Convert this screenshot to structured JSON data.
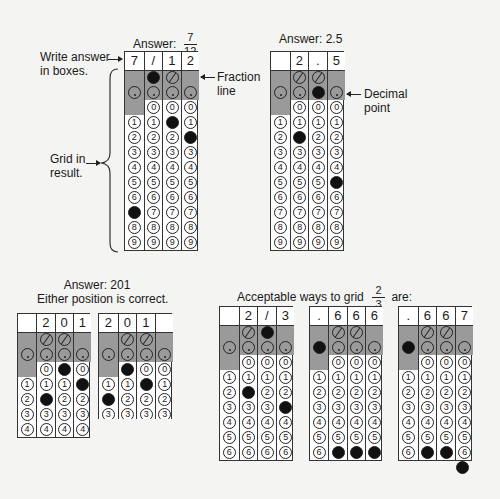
{
  "labels": {
    "write_answer": [
      "Write answer",
      "in boxes."
    ],
    "grid_in": [
      "Grid in",
      "result."
    ],
    "fraction_line": [
      "Fraction",
      "line"
    ],
    "decimal_point": [
      "Decimal",
      "point"
    ],
    "answer_201_title": "Answer: 201",
    "answer_201_sub": "Either position is correct.",
    "acceptable_prefix": "Acceptable ways to grid",
    "acceptable_suffix": "are:",
    "acceptable_num": "2",
    "acceptable_den": "3"
  },
  "grids": [
    {
      "id": "g-7-12",
      "title_prefix": "Answer:",
      "title_num": "7",
      "title_den": "12",
      "x": 124,
      "y": 51,
      "w": 74,
      "rows": 9,
      "boxes": [
        "7",
        "/",
        "1",
        "2"
      ],
      "slash": [
        null,
        "filled",
        "empty",
        null
      ],
      "dot": [
        "empty",
        "empty",
        "empty",
        "empty"
      ],
      "fills": [
        7,
        null,
        1,
        2
      ]
    },
    {
      "id": "g-2-5",
      "title": "Answer: 2.5",
      "x": 270,
      "y": 51,
      "w": 74,
      "rows": 9,
      "boxes": [
        "",
        "2",
        ".",
        "5"
      ],
      "slash": [
        null,
        "empty",
        "empty",
        null
      ],
      "dot": [
        "empty",
        "empty",
        "filled",
        "empty"
      ],
      "fills": [
        null,
        2,
        null,
        5
      ]
    },
    {
      "id": "g-201-a",
      "x": 17,
      "y": 313,
      "w": 73,
      "rows": 4,
      "boxes": [
        "",
        "2",
        "0",
        "1"
      ],
      "slash": [
        null,
        "empty",
        "empty",
        null
      ],
      "dot": [
        "empty",
        "empty",
        "empty",
        "empty"
      ],
      "fills": [
        null,
        2,
        0,
        1
      ]
    },
    {
      "id": "g-201-b",
      "x": 98,
      "y": 313,
      "w": 74,
      "rows": 3,
      "torn": true,
      "boxes": [
        "2",
        "0",
        "1",
        ""
      ],
      "slash": [
        null,
        "empty",
        "empty",
        null
      ],
      "dot": [
        "empty",
        "empty",
        "empty",
        "empty"
      ],
      "fills": [
        2,
        0,
        1,
        null
      ]
    },
    {
      "id": "g-2-3-fraction",
      "x": 219,
      "y": 306,
      "w": 74,
      "rows": 6,
      "boxes": [
        "",
        "2",
        "/",
        "3"
      ],
      "slash": [
        null,
        "empty",
        "filled",
        null
      ],
      "dot": [
        "empty",
        "empty",
        "empty",
        "empty"
      ],
      "fills": [
        null,
        2,
        null,
        3
      ]
    },
    {
      "id": "g-666",
      "x": 309,
      "y": 306,
      "w": 73,
      "rows": 6,
      "boxes": [
        ".",
        "6",
        "6",
        "6"
      ],
      "slash": [
        null,
        "empty",
        "empty",
        null
      ],
      "dot": [
        "filled",
        "empty",
        "empty",
        "empty"
      ],
      "fills": [
        null,
        6,
        6,
        6
      ]
    },
    {
      "id": "g-667",
      "x": 398,
      "y": 306,
      "w": 74,
      "rows": 6,
      "extra7": true,
      "boxes": [
        ".",
        "6",
        "6",
        "7"
      ],
      "slash": [
        null,
        "empty",
        "empty",
        null
      ],
      "dot": [
        "filled",
        "empty",
        "empty",
        "empty"
      ],
      "fills": [
        null,
        6,
        6,
        7
      ]
    }
  ]
}
